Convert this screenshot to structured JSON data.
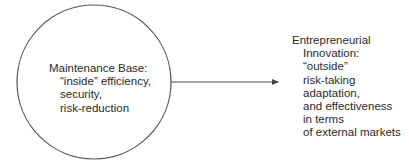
{
  "diagram": {
    "left_node": {
      "shape": "circle",
      "lines": [
        "Maintenance Base:",
        "“inside” efficiency,",
        "security,",
        "risk-reduction"
      ]
    },
    "arrow": {
      "direction": "left-to-right",
      "from": "left_node",
      "to": "right_node"
    },
    "right_node": {
      "shape": "none",
      "lines": [
        "Entrepreneurial",
        "Innovation:",
        "“outside”",
        "risk-taking",
        "adaptation,",
        "and effectiveness",
        "in terms",
        "of external markets"
      ]
    },
    "colors": {
      "stroke": "#555555",
      "text": "#2a2a2a",
      "background": "#ffffff"
    }
  }
}
